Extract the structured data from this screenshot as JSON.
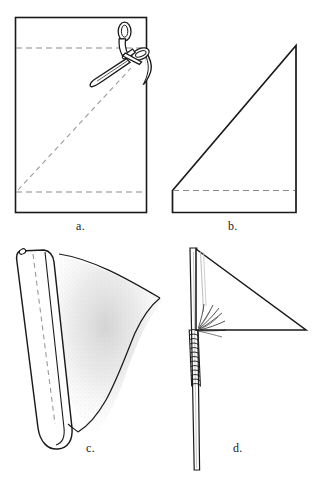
{
  "figure": {
    "width": 317,
    "height": 484,
    "background_color": "#ffffff",
    "ink_color": "#1a1a1a",
    "fold_line_color": "#8a8a8a",
    "shading_color": "#cfcfcf",
    "panel_count": 4
  },
  "panels": [
    {
      "id": "a",
      "label": "a.",
      "caption_text": "a.",
      "description": "Rectangular cloth with two horizontal dashed fold lines and scissors cutting along a diagonal dashed line",
      "elements": [
        "cloth-rectangle",
        "upper-dashed-fold-line",
        "lower-dashed-fold-line",
        "diagonal-dashed-cut-line",
        "scissors"
      ]
    },
    {
      "id": "b",
      "label": "b.",
      "caption_text": "b.",
      "description": "Cut cloth forming a right triangle above a rectangular hem strip marked by a dashed line",
      "elements": [
        "triangle-body",
        "hem-strip",
        "dashed-hem-fold-line"
      ]
    },
    {
      "id": "c",
      "label": "c.",
      "caption_text": "c.",
      "description": "Flag with the left edge rolled into a sleeve, stitched with a dashed seam line, fabric draping to the right",
      "elements": [
        "rolled-sleeve-tube",
        "dashed-stitch-seam",
        "draped-flag-body",
        "stipple-shading"
      ]
    },
    {
      "id": "d",
      "label": "d.",
      "caption_text": "d.",
      "description": "Finished triangular pennant mounted on a vertical pole, lashed with wrapped binding cord and frayed ends",
      "elements": [
        "pole",
        "pennant-triangle",
        "binding-wraps",
        "frayed-cord-ends",
        "sleeve-guide-lines"
      ]
    }
  ],
  "labels": {
    "a": "a.",
    "b": "b.",
    "c": "c.",
    "d": "d."
  },
  "colors": {
    "ink": "#1a1a1a",
    "dashed": "#8a8a8a",
    "paper": "#ffffff",
    "stipple": "#d2d2d2"
  }
}
